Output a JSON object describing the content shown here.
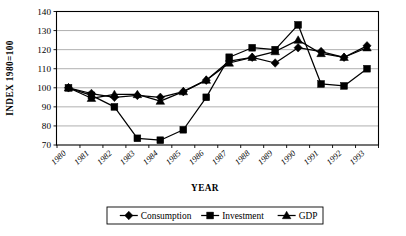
{
  "chart_data": {
    "type": "line",
    "title": "",
    "xlabel": "YEAR",
    "ylabel": "INDEX 1980=100",
    "ylim": [
      70,
      140
    ],
    "ytick_step": 10,
    "yticks": [
      70,
      80,
      90,
      100,
      110,
      120,
      130,
      140
    ],
    "grid": true,
    "legend_position": "bottom",
    "categories": [
      "1980",
      "1981",
      "1982",
      "1983",
      "1984",
      "1985",
      "1986",
      "1987",
      "1988",
      "1989",
      "1990",
      "1991",
      "1992",
      "1993"
    ],
    "series": [
      {
        "name": "Consumption",
        "marker": "diamond",
        "values": [
          100,
          97,
          95,
          96,
          95,
          98,
          104,
          114,
          116,
          113,
          121,
          119,
          116,
          122
        ]
      },
      {
        "name": "Investment",
        "marker": "square",
        "values": [
          100,
          96,
          90,
          73.5,
          72.5,
          78,
          95,
          116,
          121,
          120,
          133,
          102,
          101,
          110
        ]
      },
      {
        "name": "GDP",
        "marker": "triangle",
        "values": [
          100,
          94.5,
          96.5,
          96.5,
          93,
          98,
          104,
          113,
          116,
          119,
          125,
          118,
          116,
          121
        ]
      }
    ],
    "colors": {
      "series_stroke": "#000000",
      "grid": "#8d8d8d",
      "axis": "#000000",
      "background": "#ffffff"
    }
  }
}
